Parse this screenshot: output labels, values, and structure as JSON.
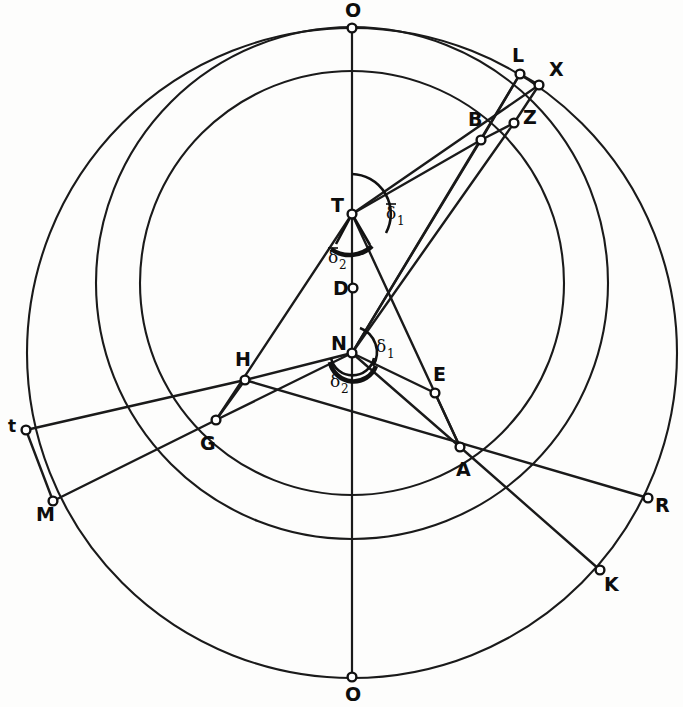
{
  "figure": {
    "background_color": "#fdfdfc",
    "ink_color": "#1a1a1a"
  },
  "points": [
    {
      "id": "O_top",
      "label": "O",
      "x": 352,
      "y": 28,
      "label_x": 345,
      "label_y": 17,
      "marker": true
    },
    {
      "id": "L",
      "label": "L",
      "x": 520,
      "y": 74,
      "label_x": 512,
      "label_y": 62,
      "marker": true
    },
    {
      "id": "X",
      "label": "X",
      "x": 539,
      "y": 85,
      "label_x": 549,
      "label_y": 76,
      "marker": true
    },
    {
      "id": "Z",
      "label": "Z",
      "x": 514,
      "y": 123,
      "label_x": 523,
      "label_y": 124,
      "marker": true
    },
    {
      "id": "B",
      "label": "B",
      "x": 481,
      "y": 140,
      "label_x": 468,
      "label_y": 126,
      "marker": true
    },
    {
      "id": "T",
      "label": "T",
      "x": 352,
      "y": 214,
      "label_x": 331,
      "label_y": 212,
      "marker": true
    },
    {
      "id": "D",
      "label": "D",
      "x": 353,
      "y": 288,
      "label_x": 333,
      "label_y": 295,
      "marker": true
    },
    {
      "id": "N",
      "label": "N",
      "x": 352,
      "y": 353,
      "label_x": 331,
      "label_y": 350,
      "marker": true
    },
    {
      "id": "H",
      "label": "H",
      "x": 245,
      "y": 380,
      "label_x": 235,
      "label_y": 366,
      "marker": true
    },
    {
      "id": "E",
      "label": "E",
      "x": 435,
      "y": 393,
      "label_x": 433,
      "label_y": 381,
      "marker": true
    },
    {
      "id": "G",
      "label": "G",
      "x": 216,
      "y": 420,
      "label_x": 200,
      "label_y": 450,
      "marker": true
    },
    {
      "id": "t",
      "label": "t",
      "x": 26,
      "y": 430,
      "label_x": 8,
      "label_y": 432,
      "marker": true
    },
    {
      "id": "A",
      "label": "A",
      "x": 460,
      "y": 447,
      "label_x": 456,
      "label_y": 476,
      "marker": true
    },
    {
      "id": "R",
      "label": "R",
      "x": 648,
      "y": 498,
      "label_x": 655,
      "label_y": 512,
      "marker": true
    },
    {
      "id": "M",
      "label": "M",
      "x": 53,
      "y": 501,
      "label_x": 36,
      "label_y": 521,
      "marker": true
    },
    {
      "id": "K",
      "label": "K",
      "x": 600,
      "y": 570,
      "label_x": 604,
      "label_y": 591,
      "marker": true
    },
    {
      "id": "O_bottom",
      "label": "O",
      "x": 352,
      "y": 677,
      "label_x": 345,
      "label_y": 701,
      "marker": true
    }
  ],
  "angle_labels": [
    {
      "id": "delta_bar_1",
      "base": "δ",
      "sub": "1",
      "overbar": true,
      "x": 386,
      "y": 219
    },
    {
      "id": "delta_bar_2",
      "base": "δ",
      "sub": "2",
      "overbar": true,
      "x": 328,
      "y": 263
    },
    {
      "id": "delta_1",
      "base": "δ",
      "sub": "1",
      "overbar": false,
      "x": 376,
      "y": 352
    },
    {
      "id": "delta_2",
      "base": "δ",
      "sub": "2",
      "overbar": false,
      "x": 330,
      "y": 387
    }
  ],
  "circles": [
    {
      "id": "outer-circle",
      "cx": 352,
      "cy": 353,
      "r": 325,
      "name": "outer-deferent-circle"
    },
    {
      "id": "middle-circle",
      "cx": 352,
      "cy": 283,
      "r": 256,
      "name": "middle-eccentric-circle"
    },
    {
      "id": "inner-circle",
      "cx": 352,
      "cy": 283,
      "r": 212,
      "name": "inner-epicycle-circle"
    }
  ],
  "vertical_axis": {
    "id": "apsidal-line",
    "x": 352,
    "y1": 28,
    "y2": 677
  },
  "chords": [
    {
      "id": "chord-T-B",
      "from": "T",
      "to": "B"
    },
    {
      "id": "chord-T-X",
      "from": "T",
      "to": "X"
    },
    {
      "id": "chord-T-A",
      "from": "T",
      "to": "A"
    },
    {
      "id": "chord-T-G",
      "from": "T",
      "to": "G"
    },
    {
      "id": "chord-N-B",
      "from": "N",
      "to": "B"
    },
    {
      "id": "chord-N-L",
      "from": "N",
      "to": "L"
    },
    {
      "id": "chord-N-Z",
      "from": "N",
      "to": "Z"
    },
    {
      "id": "chord-N-E",
      "from": "N",
      "to": "E"
    },
    {
      "id": "chord-N-A",
      "from": "N",
      "to": "A"
    },
    {
      "id": "chord-N-H",
      "from": "N",
      "to": "H"
    },
    {
      "id": "chord-N-G",
      "from": "N",
      "to": "G"
    },
    {
      "id": "chord-B-L",
      "from": "B",
      "to": "L"
    },
    {
      "id": "chord-B-Z",
      "from": "B",
      "to": "Z"
    },
    {
      "id": "chord-L-X",
      "from": "L",
      "to": "X"
    },
    {
      "id": "chord-Z-X",
      "from": "Z",
      "to": "X"
    },
    {
      "id": "chord-t-H",
      "from": "t",
      "to": "H"
    },
    {
      "id": "chord-t-M",
      "from": "t",
      "to": "M"
    },
    {
      "id": "chord-M-G",
      "from": "M",
      "to": "G"
    },
    {
      "id": "chord-H-G",
      "from": "H",
      "to": "G"
    },
    {
      "id": "chord-E-A",
      "from": "E",
      "to": "A"
    },
    {
      "id": "chord-E-R",
      "from": "E",
      "to": "R"
    },
    {
      "id": "chord-A-R",
      "from": "A",
      "to": "R"
    },
    {
      "id": "chord-A-K",
      "from": "A",
      "to": "K"
    },
    {
      "id": "chord-H-E",
      "from": "H",
      "to": "E"
    }
  ]
}
